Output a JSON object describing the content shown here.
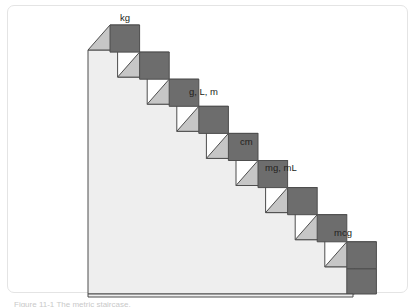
{
  "figure": {
    "caption": "Figure 11-1  The metric staircase.",
    "border_color": "#e4e4e4",
    "background_color": "#ffffff"
  },
  "diagram": {
    "type": "isometric-staircase",
    "step_count": 9,
    "direction": "descending-left-to-right",
    "colors": {
      "tread_top": "#c6c6c6",
      "riser_front": "#6d6d6d",
      "body_wall": "#eeeeee",
      "outline": "#4d4d4d",
      "text": "#231f20"
    },
    "geometry": {
      "origin_x": 88,
      "origin_y": 50,
      "step_width": 29.6,
      "step_height": 27.1,
      "depth_x": 22,
      "depth_y": -25,
      "base_y": 294,
      "base_right_x": 353
    },
    "labels": [
      {
        "text": "kg",
        "step": 1,
        "x": 120,
        "y": 21
      },
      {
        "text": "g, L, m",
        "step": 3,
        "x": 189,
        "y": 95
      },
      {
        "text": "cm",
        "step": 5,
        "x": 240,
        "y": 145
      },
      {
        "text": "mg, mL",
        "step": 6,
        "x": 265,
        "y": 171
      },
      {
        "text": "mcg",
        "step": 9,
        "x": 334,
        "y": 236
      }
    ],
    "units_top_to_bottom": [
      "kg",
      "g, L, m",
      "cm",
      "mg, mL",
      "mcg"
    ]
  }
}
